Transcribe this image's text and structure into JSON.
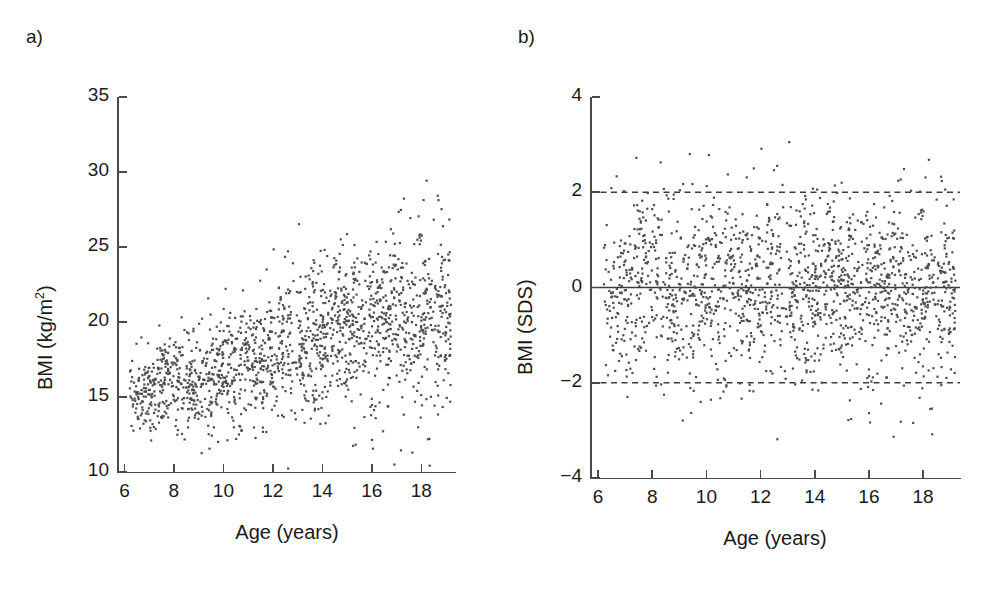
{
  "figure": {
    "background": "#ffffff",
    "point_color": "#4d4d4d",
    "axis_color": "#4a4a4a",
    "text_color": "#1a1a1a"
  },
  "panels": [
    {
      "key": "a",
      "label": "a)",
      "xlabel": "Age (years)",
      "ylabel_pre": "BMI (kg/m",
      "ylabel_sup": "2",
      "ylabel_post": ")",
      "ylabel_plain": "BMI (kg/m2)",
      "xticks": [
        "6",
        "8",
        "10",
        "12",
        "14",
        "16",
        "18"
      ],
      "yticks": [
        "35",
        "30",
        "25",
        "20",
        "15",
        "10"
      ]
    },
    {
      "key": "b",
      "label": "b)",
      "xlabel": "Age (years)",
      "ylabel_pre": "BMI (SDS)",
      "ylabel_sup": "",
      "ylabel_post": "",
      "ylabel_plain": "BMI (SDS)",
      "xticks": [
        "6",
        "8",
        "10",
        "12",
        "14",
        "16",
        "18"
      ],
      "yticks": [
        "4",
        "2",
        "0",
        "−2",
        "−4"
      ]
    }
  ],
  "chart_data": [
    {
      "type": "scatter",
      "panel": "a",
      "title": "a)",
      "xlabel": "Age (years)",
      "ylabel": "BMI (kg/m2)",
      "xlim": [
        5.7,
        19.4
      ],
      "ylim": [
        10,
        35
      ],
      "xticks": [
        6,
        8,
        10,
        12,
        14,
        16,
        18
      ],
      "yticks": [
        10,
        15,
        20,
        25,
        30,
        35
      ],
      "grid": false,
      "legend": "none",
      "n_points": 1700,
      "marker": {
        "shape": "square",
        "size_px": 2.2,
        "color": "#4d4d4d"
      },
      "reference_lines": [],
      "description": "BMI in kg/m2 plotted against age; mean BMI rises roughly linearly from about 15.3 at age 6.5 to about 20.6 at age 19, with the scatter spread widening with age (SD about 1.4 at age 6.5 rising to about 3.2 at age 19). Upper outliers reach 34 around ages 12.5 and 18.5; lower edge stays near 12-13.",
      "trend": {
        "x": [
          6.5,
          7.5,
          8.5,
          9.5,
          10.5,
          11.5,
          12.5,
          13.5,
          14.5,
          15.5,
          16.5,
          17.5,
          18.5
        ],
        "mean_y": [
          15.4,
          15.6,
          16.0,
          16.5,
          17.0,
          17.6,
          18.2,
          18.8,
          19.4,
          19.9,
          20.2,
          20.4,
          20.6
        ],
        "sd_y": [
          1.4,
          1.5,
          1.7,
          1.9,
          2.1,
          2.3,
          2.5,
          2.7,
          2.8,
          2.9,
          3.0,
          3.1,
          3.2
        ]
      }
    },
    {
      "type": "scatter",
      "panel": "b",
      "title": "b)",
      "xlabel": "Age (years)",
      "ylabel": "BMI (SDS)",
      "xlim": [
        5.7,
        19.4
      ],
      "ylim": [
        -4,
        4
      ],
      "xticks": [
        6,
        8,
        10,
        12,
        14,
        16,
        18
      ],
      "yticks": [
        -4,
        -2,
        0,
        2,
        4
      ],
      "grid": false,
      "legend": "none",
      "n_points": 1700,
      "marker": {
        "shape": "square",
        "size_px": 2.2,
        "color": "#4d4d4d"
      },
      "reference_lines": [
        {
          "y": 2,
          "style": "dashed",
          "color": "#3c3c3c"
        },
        {
          "y": 0,
          "style": "solid",
          "color": "#3c3c3c"
        },
        {
          "y": -2,
          "style": "dashed",
          "color": "#3c3c3c"
        }
      ],
      "description": "BMI expressed as standard deviation scores plotted against age; the cloud is centred on 0 with approximately constant spread (SD about 1.0) across the whole age range. Roughly 95 percent of points lie between the dashed lines at -2 and +2. Extreme values reach about +3.6 near age 18.7 and about -3.4 near age 6.7.",
      "trend": {
        "x": [
          6.5,
          7.5,
          8.5,
          9.5,
          10.5,
          11.5,
          12.5,
          13.5,
          14.5,
          15.5,
          16.5,
          17.5,
          18.5
        ],
        "mean_y": [
          -0.05,
          -0.02,
          0.0,
          0.02,
          0.03,
          0.02,
          0.0,
          -0.01,
          0.0,
          0.02,
          0.01,
          0.0,
          -0.02
        ],
        "sd_y": [
          0.95,
          0.98,
          1.0,
          1.02,
          1.03,
          1.02,
          1.0,
          1.0,
          1.01,
          1.0,
          0.98,
          0.97,
          0.96
        ]
      }
    }
  ]
}
